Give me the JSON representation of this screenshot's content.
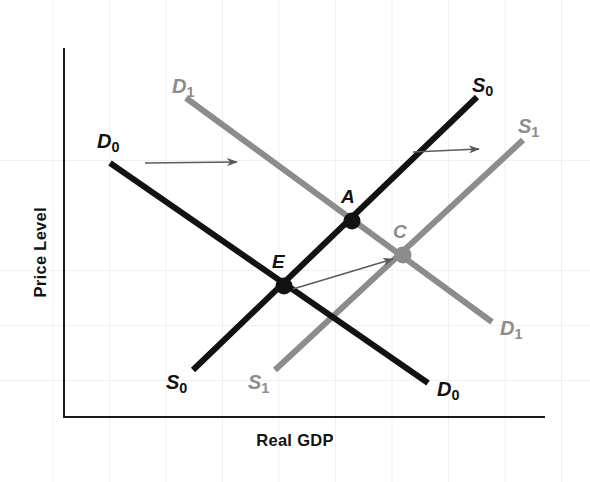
{
  "figure": {
    "type": "economics-ad-as-diagram",
    "background_color": "#ffffff",
    "grid": {
      "visible": true,
      "color": "#eef1f4"
    },
    "axes": {
      "x_label": "Real GDP",
      "y_label": "Price Level",
      "axis_color": "#1a1a1a",
      "origin": {
        "x": 64,
        "y": 417
      },
      "x_end": {
        "x": 545,
        "y": 417
      },
      "y_top": {
        "x": 64,
        "y": 48
      }
    },
    "colors": {
      "original": "#121212",
      "shifted": "#8c8c8c",
      "arrow": "#5a5a5a"
    },
    "curves": [
      {
        "name": "D0",
        "label": "D",
        "subscript": "0",
        "series": "demand-original",
        "color": "#121212",
        "start": {
          "x": 110,
          "y": 163
        },
        "end": {
          "x": 428,
          "y": 383
        },
        "label_top": {
          "text": "D",
          "sub": "0",
          "x": 97,
          "y": 131
        },
        "label_bottom": {
          "text": "D",
          "sub": "0",
          "x": 437,
          "y": 379
        }
      },
      {
        "name": "D1",
        "label": "D",
        "subscript": "1",
        "series": "demand-shifted",
        "color": "#8c8c8c",
        "start": {
          "x": 186,
          "y": 98
        },
        "end": {
          "x": 492,
          "y": 322
        },
        "label_top": {
          "text": "D",
          "sub": "1",
          "x": 172,
          "y": 76
        },
        "label_bottom": {
          "text": "D",
          "sub": "1",
          "x": 500,
          "y": 318
        }
      },
      {
        "name": "S0",
        "label": "S",
        "subscript": "0",
        "series": "supply-original",
        "color": "#121212",
        "start": {
          "x": 193,
          "y": 370
        },
        "end": {
          "x": 477,
          "y": 97
        },
        "label_top": {
          "text": "S",
          "sub": "0",
          "x": 472,
          "y": 75
        },
        "label_bottom": {
          "text": "S",
          "sub": "0",
          "x": 166,
          "y": 372
        }
      },
      {
        "name": "S1",
        "label": "S",
        "subscript": "1",
        "series": "supply-shifted",
        "color": "#8c8c8c",
        "start": {
          "x": 275,
          "y": 370
        },
        "end": {
          "x": 523,
          "y": 140
        },
        "label_top": {
          "text": "S",
          "sub": "1",
          "x": 518,
          "y": 116
        },
        "label_bottom": {
          "text": "S",
          "sub": "1",
          "x": 248,
          "y": 372
        }
      }
    ],
    "points": [
      {
        "name": "E",
        "label": "E",
        "description": "original equilibrium D0 x S0",
        "x": 284,
        "y": 286,
        "radius": 8.5,
        "color": "#121212",
        "label_x": 272,
        "label_y": 252
      },
      {
        "name": "A",
        "label": "A",
        "description": "intersection D1 x S0",
        "x": 352,
        "y": 221,
        "radius": 8.5,
        "color": "#121212",
        "label_x": 341,
        "label_y": 187
      },
      {
        "name": "C",
        "label": "C",
        "description": "new equilibrium D1 x S1",
        "x": 403,
        "y": 255,
        "radius": 8.5,
        "color": "#8c8c8c",
        "label_x": 393,
        "label_y": 222
      }
    ],
    "arrows": [
      {
        "name": "demand-shift-arrow",
        "from": {
          "x": 145,
          "y": 163
        },
        "to": {
          "x": 237,
          "y": 162
        },
        "color": "#5a5a5a"
      },
      {
        "name": "supply-shift-arrow",
        "from": {
          "x": 413,
          "y": 152
        },
        "to": {
          "x": 479,
          "y": 149
        },
        "color": "#5a5a5a"
      },
      {
        "name": "equilibrium-move-arrow",
        "from": {
          "x": 293,
          "y": 289
        },
        "to": {
          "x": 393,
          "y": 259
        },
        "color": "#5a5a5a"
      }
    ]
  }
}
